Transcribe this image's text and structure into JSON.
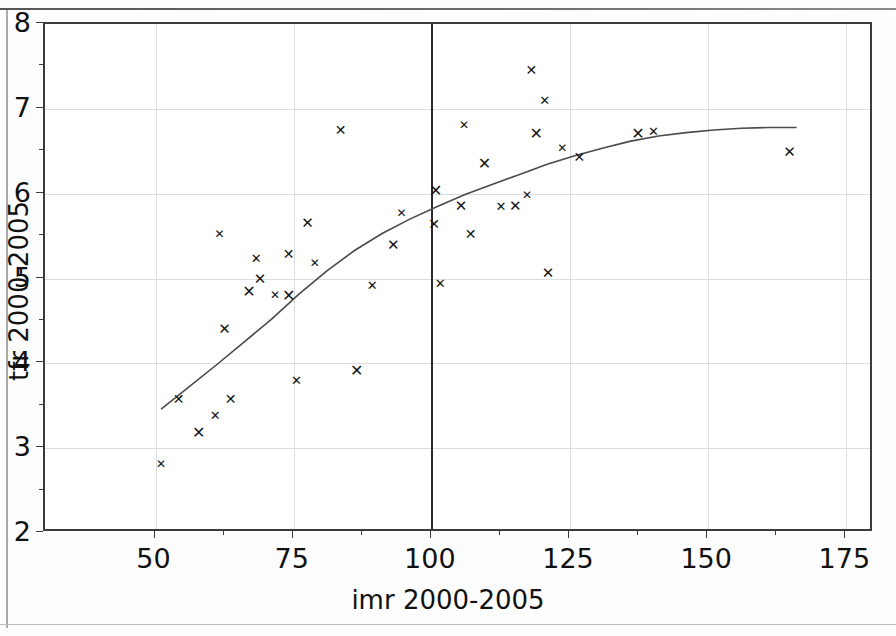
{
  "figure": {
    "background_color": "#ffffff",
    "frame_color": "#3b3b3b",
    "grid_color": "#dddddd",
    "marker_color": "#141414",
    "curve_color": "#4a4a4a",
    "reference_line_color": "#2a2a2a"
  },
  "chart_data": {
    "type": "scatter",
    "title": "",
    "xlabel": "imr 2000-2005",
    "ylabel": "tfr 2000-2005",
    "xlim": [
      30,
      180
    ],
    "ylim": [
      2,
      8
    ],
    "xticks": [
      50,
      75,
      100,
      125,
      150,
      175
    ],
    "xtick_labels": [
      "50",
      "75",
      "100",
      "125",
      "150",
      "175"
    ],
    "yticks": [
      2,
      3,
      4,
      5,
      6,
      7,
      8
    ],
    "ytick_labels": [
      "2",
      "3",
      "4",
      "5",
      "6",
      "7",
      "8"
    ],
    "x_minor_ticks": [
      62.5,
      87.5,
      112.5,
      137.5,
      162.5
    ],
    "y_minor_ticks": [
      2.5,
      3.5,
      4.5,
      5.5,
      6.5,
      7.5
    ],
    "grid": true,
    "legend": null,
    "marker": "x",
    "annotations": [
      {
        "type": "vertical-reference-line",
        "x": 100
      }
    ],
    "points": [
      {
        "x": 51.0,
        "y": 2.81
      },
      {
        "x": 54.2,
        "y": 3.58
      },
      {
        "x": 57.8,
        "y": 3.18
      },
      {
        "x": 60.8,
        "y": 3.39
      },
      {
        "x": 62.5,
        "y": 4.4
      },
      {
        "x": 61.6,
        "y": 5.52
      },
      {
        "x": 63.6,
        "y": 3.58
      },
      {
        "x": 66.9,
        "y": 4.84
      },
      {
        "x": 68.2,
        "y": 5.24
      },
      {
        "x": 68.9,
        "y": 5.0
      },
      {
        "x": 71.6,
        "y": 4.81
      },
      {
        "x": 74.1,
        "y": 5.29
      },
      {
        "x": 74.1,
        "y": 4.79
      },
      {
        "x": 75.5,
        "y": 3.8
      },
      {
        "x": 77.5,
        "y": 5.66
      },
      {
        "x": 78.8,
        "y": 5.18
      },
      {
        "x": 83.5,
        "y": 6.75
      },
      {
        "x": 86.4,
        "y": 3.91
      },
      {
        "x": 89.2,
        "y": 4.92
      },
      {
        "x": 93.0,
        "y": 5.39
      },
      {
        "x": 94.5,
        "y": 5.77
      },
      {
        "x": 100.4,
        "y": 5.64
      },
      {
        "x": 100.7,
        "y": 6.03
      },
      {
        "x": 101.5,
        "y": 4.95
      },
      {
        "x": 105.3,
        "y": 5.86
      },
      {
        "x": 105.8,
        "y": 6.81
      },
      {
        "x": 107.0,
        "y": 5.52
      },
      {
        "x": 109.5,
        "y": 6.35
      },
      {
        "x": 112.5,
        "y": 5.85
      },
      {
        "x": 115.1,
        "y": 5.85
      },
      {
        "x": 117.2,
        "y": 5.99
      },
      {
        "x": 118.0,
        "y": 7.46
      },
      {
        "x": 118.9,
        "y": 6.7
      },
      {
        "x": 120.4,
        "y": 7.11
      },
      {
        "x": 121.0,
        "y": 5.06
      },
      {
        "x": 123.6,
        "y": 6.54
      },
      {
        "x": 126.7,
        "y": 6.43
      },
      {
        "x": 137.3,
        "y": 6.7
      },
      {
        "x": 140.1,
        "y": 6.74
      },
      {
        "x": 164.7,
        "y": 6.49
      }
    ],
    "fit_curve": {
      "name": "lowess-fit",
      "points": [
        {
          "x": 51.0,
          "y": 3.46
        },
        {
          "x": 56.0,
          "y": 3.72
        },
        {
          "x": 61.0,
          "y": 3.98
        },
        {
          "x": 66.0,
          "y": 4.25
        },
        {
          "x": 71.0,
          "y": 4.52
        },
        {
          "x": 76.0,
          "y": 4.82
        },
        {
          "x": 81.0,
          "y": 5.09
        },
        {
          "x": 86.0,
          "y": 5.33
        },
        {
          "x": 91.0,
          "y": 5.53
        },
        {
          "x": 96.0,
          "y": 5.7
        },
        {
          "x": 101.0,
          "y": 5.85
        },
        {
          "x": 106.0,
          "y": 5.99
        },
        {
          "x": 111.0,
          "y": 6.11
        },
        {
          "x": 116.0,
          "y": 6.23
        },
        {
          "x": 121.0,
          "y": 6.35
        },
        {
          "x": 126.0,
          "y": 6.45
        },
        {
          "x": 131.0,
          "y": 6.54
        },
        {
          "x": 136.0,
          "y": 6.62
        },
        {
          "x": 141.0,
          "y": 6.68
        },
        {
          "x": 146.0,
          "y": 6.72
        },
        {
          "x": 151.0,
          "y": 6.75
        },
        {
          "x": 156.0,
          "y": 6.77
        },
        {
          "x": 161.0,
          "y": 6.78
        },
        {
          "x": 166.0,
          "y": 6.78
        }
      ]
    }
  }
}
